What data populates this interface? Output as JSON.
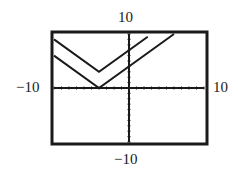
{
  "chart_data": {
    "type": "line",
    "title": "",
    "xlabel": "",
    "ylabel": "",
    "xlim": [
      -10,
      10
    ],
    "ylim": [
      -10,
      10
    ],
    "xscale_ticks": 1,
    "yscale_ticks": 1,
    "grid": false,
    "window_labels": {
      "ymax": "10",
      "ymin": "-10",
      "xmin": "−10",
      "xmax": "10"
    },
    "series": [
      {
        "name": "upper V",
        "vertex": [
          -4,
          3
        ],
        "points": [
          [
            -10,
            9
          ],
          [
            -4,
            3
          ],
          [
            2.5,
            9.5
          ]
        ]
      },
      {
        "name": "lower V",
        "vertex": [
          -4,
          0
        ],
        "points": [
          [
            -10,
            6
          ],
          [
            -4,
            0
          ],
          [
            6,
            10
          ]
        ]
      }
    ]
  },
  "labels": {
    "top": "10",
    "bottom": "−10",
    "left": "−10",
    "right": "10"
  }
}
